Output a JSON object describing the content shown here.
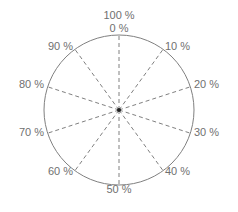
{
  "diagram": {
    "center": [
      119,
      110
    ],
    "radius": 75,
    "colors": {
      "circle": "#808080",
      "spokes": "#808080",
      "text": "#707070",
      "center": "#222222"
    },
    "labels": [
      {
        "text": "100 %",
        "x": 119,
        "y": 19,
        "anchor": "middle"
      },
      {
        "text": "0 %",
        "x": 119,
        "y": 32,
        "anchor": "middle"
      },
      {
        "text": "10 %",
        "x": 165,
        "y": 50,
        "anchor": "start"
      },
      {
        "text": "20 %",
        "x": 194,
        "y": 88,
        "anchor": "start"
      },
      {
        "text": "30 %",
        "x": 194,
        "y": 136,
        "anchor": "start"
      },
      {
        "text": "40 %",
        "x": 165,
        "y": 175,
        "anchor": "start"
      },
      {
        "text": "50 %",
        "x": 119,
        "y": 193,
        "anchor": "middle"
      },
      {
        "text": "60 %",
        "x": 73,
        "y": 175,
        "anchor": "end"
      },
      {
        "text": "70 %",
        "x": 44,
        "y": 136,
        "anchor": "end"
      },
      {
        "text": "80 %",
        "x": 44,
        "y": 88,
        "anchor": "end"
      },
      {
        "text": "90 %",
        "x": 73,
        "y": 50,
        "anchor": "end"
      }
    ],
    "spoke_count": 10
  }
}
